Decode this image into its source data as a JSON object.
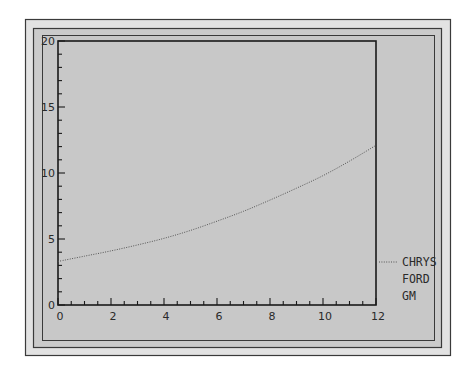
{
  "colors": {
    "outer_band": "#e2e2e2",
    "panel_bg": "#c8c8c8",
    "frame_line": "#3a3a3a",
    "axis_line": "#1a1a1a",
    "series_line": "#555555",
    "text": "#2a2a2a"
  },
  "chart_data": {
    "type": "line",
    "title": "",
    "xlabel": "",
    "ylabel": "",
    "xlim": [
      0,
      12
    ],
    "ylim": [
      0,
      20
    ],
    "x_ticks": [
      0,
      2,
      4,
      6,
      8,
      10,
      12
    ],
    "x_tick_labels": [
      "0",
      "2",
      "4",
      "6",
      "8",
      "10",
      "12"
    ],
    "x_minor_step": 0.5,
    "y_ticks": [
      0,
      5,
      10,
      15,
      20
    ],
    "y_tick_labels": [
      "0",
      "5",
      "10",
      "15",
      "20"
    ],
    "y_minor_step": 1,
    "grid": false,
    "legend_position": "right",
    "legend": [
      "CHRYS",
      "FORD",
      "GM"
    ],
    "series": [
      {
        "name": "CHRYS",
        "style": "dotted",
        "x": [
          0,
          1,
          2,
          3,
          4,
          5,
          6,
          7,
          8,
          9,
          10,
          11,
          12
        ],
        "values": [
          3.3,
          3.7,
          4.1,
          4.55,
          5.05,
          5.65,
          6.35,
          7.1,
          7.95,
          8.85,
          9.8,
          10.9,
          12.1
        ]
      },
      {
        "name": "FORD",
        "style": "none",
        "x": [],
        "values": []
      },
      {
        "name": "GM",
        "style": "none",
        "x": [],
        "values": []
      }
    ]
  }
}
